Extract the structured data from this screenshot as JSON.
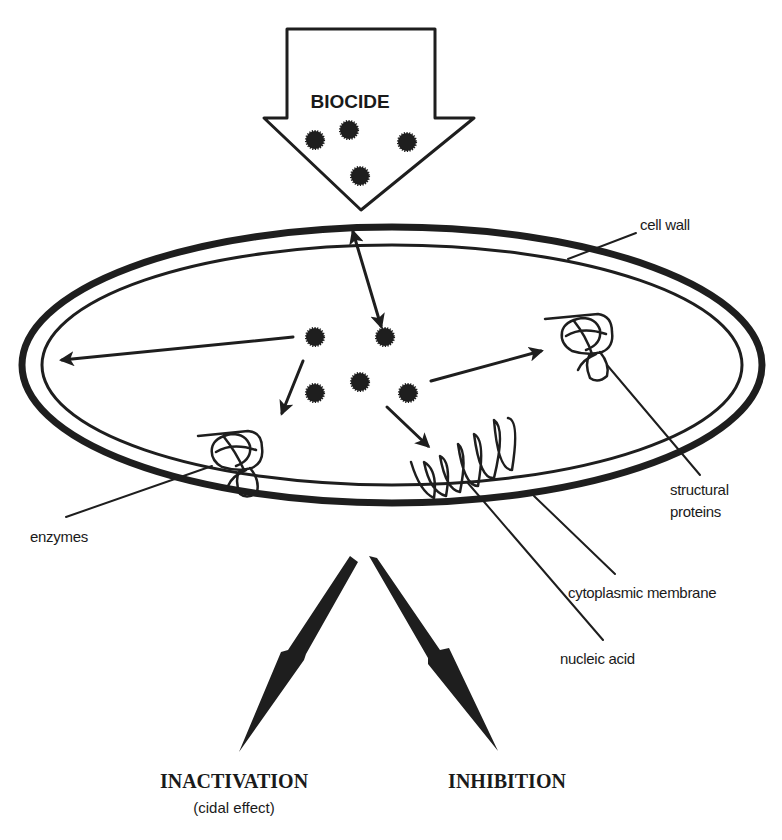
{
  "diagram": {
    "type": "biological-mechanism",
    "source_label": "BIOCIDE",
    "labels": {
      "cell_wall": "cell wall",
      "enzymes": "enzymes",
      "structural_proteins_line1": "structural",
      "structural_proteins_line2": "proteins",
      "cytoplasmic_membrane": "cytoplasmic membrane",
      "nucleic_acid": "nucleic acid"
    },
    "outcomes": [
      {
        "label": "INACTIVATION",
        "sublabel": "(cidal effect)"
      },
      {
        "label": "INHIBITION",
        "sublabel": ""
      }
    ],
    "nodes": [
      "BIOCIDE",
      "cell wall",
      "cytoplasmic membrane",
      "enzymes",
      "structural proteins",
      "nucleic acid",
      "INACTIVATION",
      "INHIBITION"
    ],
    "edges": [
      {
        "from": "BIOCIDE",
        "to": "cell wall"
      },
      {
        "from": "BIOCIDE",
        "to": "cytoplasmic membrane"
      },
      {
        "from": "BIOCIDE",
        "to": "enzymes"
      },
      {
        "from": "BIOCIDE",
        "to": "structural proteins"
      },
      {
        "from": "BIOCIDE",
        "to": "nucleic acid"
      },
      {
        "from": "cell",
        "to": "INACTIVATION"
      },
      {
        "from": "cell",
        "to": "INHIBITION"
      }
    ],
    "colors": {
      "ink": "#1e1e1e",
      "background": "#ffffff"
    }
  }
}
